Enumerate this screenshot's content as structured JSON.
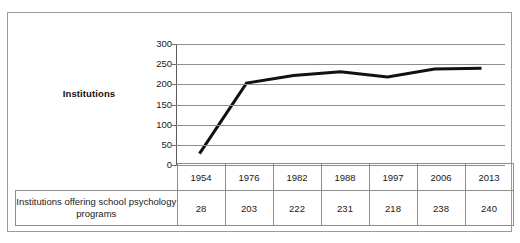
{
  "figure": {
    "axis_title": "Institutions",
    "row_label": "Institutions offering school psychology programs"
  },
  "chart_data": {
    "type": "line",
    "title": "",
    "xlabel": "",
    "ylabel": "Institutions",
    "categories": [
      "1954",
      "1976",
      "1982",
      "1988",
      "1997",
      "2006",
      "2013"
    ],
    "values": [
      28,
      203,
      222,
      231,
      218,
      238,
      240
    ],
    "series": [
      {
        "name": "Institutions offering school psychology programs",
        "values": [
          28,
          203,
          222,
          231,
          218,
          238,
          240
        ]
      }
    ],
    "ylim": [
      0,
      300
    ],
    "y_ticks": [
      300,
      250,
      200,
      150,
      100,
      50,
      0
    ],
    "y_tick_labels": [
      "300",
      "250",
      "200",
      "150",
      "100",
      "50",
      "0"
    ],
    "grid": true,
    "legend": false,
    "line_color": "#111111"
  },
  "table": {
    "row_label": "Institutions offering school psychology programs",
    "years": [
      "1954",
      "1976",
      "1982",
      "1988",
      "1997",
      "2006",
      "2013"
    ],
    "values": [
      "28",
      "203",
      "222",
      "231",
      "218",
      "238",
      "240"
    ]
  }
}
